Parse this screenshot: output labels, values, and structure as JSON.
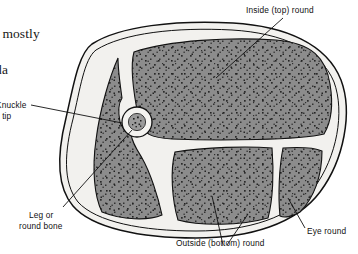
{
  "figure": {
    "kind": "anatomical-cross-section",
    "colors": {
      "background": "#ffffff",
      "muscle_fill": "#8c8c8c",
      "muscle_speckle": "#2b2b2b",
      "fat_fill": "#f2f1ee",
      "outline": "#111111",
      "bone_ring": "#f4f3f0",
      "bone_marrow": "#9a9a9a",
      "leader_line": "#111111",
      "text": "#101010",
      "body_text": "#161616"
    },
    "labels": [
      {
        "id": "inside-top-round",
        "text": "Inside (top) round",
        "region": "upper-large-muscle"
      },
      {
        "id": "knuckle",
        "text": "Knuckle",
        "region": "left-muscle",
        "truncated_left": true
      },
      {
        "id": "or-tip",
        "text": "or tip",
        "region": "left-muscle",
        "truncated_left": true
      },
      {
        "id": "leg-or",
        "text": "Leg or",
        "region": "bone"
      },
      {
        "id": "round-bone",
        "text": "round bone",
        "region": "bone"
      },
      {
        "id": "outside-bottom-round",
        "text": "Outside (bottom) round",
        "region": "lower-muscle"
      },
      {
        "id": "eye-round",
        "text": "Eye round",
        "region": "right-small-muscle"
      }
    ],
    "body_text": [
      {
        "id": "line-1",
        "text": "ed mostly",
        "truncated_left": true
      },
      {
        "id": "line-2",
        "text": "ada",
        "truncated_left": true
      },
      {
        "id": "line-3",
        "text": "e",
        "truncated_left": true
      },
      {
        "id": "line-4",
        "text": "",
        "truncated_left": true
      }
    ]
  }
}
